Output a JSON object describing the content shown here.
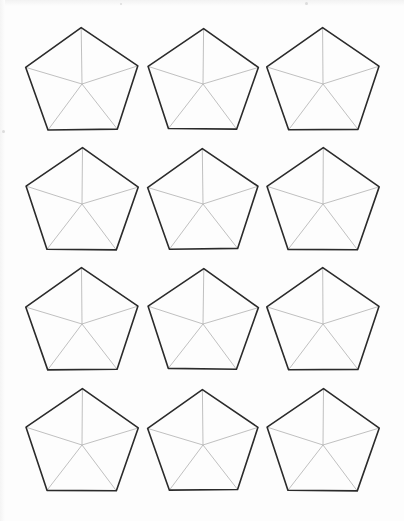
{
  "document": {
    "kind": "printable-worksheet",
    "title": "Pentagon Template Sheet",
    "description": "Grid of blank pentagons each divided into five triangles by lines from the centre to every vertex",
    "background_color": "#fdfdfd",
    "page_width": 404,
    "page_height": 521
  },
  "style": {
    "outline_color": "#2b2b2b",
    "outline_width": 1.6,
    "spoke_color": "#b0b0b0",
    "spoke_width": 0.8,
    "fill_color": "#ffffff"
  },
  "grid": {
    "rows": 4,
    "columns": 3,
    "shape_count": 12,
    "shape_name": "pentagon",
    "sides": 5,
    "spokes_per_shape": 5,
    "triangles_per_shape": 5,
    "column_pitch": 120,
    "row_pitch": 120.5,
    "shape_width": 117,
    "shape_height": 112
  },
  "shapes": [
    {
      "id": "pentagon-r1-c1",
      "row": 1,
      "column": 1,
      "center_x": 82,
      "center_y": 84,
      "radius": 59,
      "rotation": -0.8
    },
    {
      "id": "pentagon-r1-c2",
      "row": 1,
      "column": 2,
      "center_x": 203,
      "center_y": 84,
      "radius": 58,
      "rotation": 0.6
    },
    {
      "id": "pentagon-r1-c3",
      "row": 1,
      "column": 3,
      "center_x": 323,
      "center_y": 84,
      "radius": 59,
      "rotation": -0.4
    },
    {
      "id": "pentagon-r2-c1",
      "row": 2,
      "column": 1,
      "center_x": 82,
      "center_y": 204,
      "radius": 59,
      "rotation": 0.5
    },
    {
      "id": "pentagon-r2-c2",
      "row": 2,
      "column": 2,
      "center_x": 203,
      "center_y": 204,
      "radius": 58,
      "rotation": -0.7
    },
    {
      "id": "pentagon-r2-c3",
      "row": 2,
      "column": 3,
      "center_x": 323,
      "center_y": 204,
      "radius": 59,
      "rotation": 0.3
    },
    {
      "id": "pentagon-r3-c1",
      "row": 3,
      "column": 1,
      "center_x": 82,
      "center_y": 324,
      "radius": 59,
      "rotation": -0.5
    },
    {
      "id": "pentagon-r3-c2",
      "row": 3,
      "column": 2,
      "center_x": 203,
      "center_y": 324,
      "radius": 58,
      "rotation": 0.8
    },
    {
      "id": "pentagon-r3-c3",
      "row": 3,
      "column": 3,
      "center_x": 323,
      "center_y": 324,
      "radius": 59,
      "rotation": -0.3
    },
    {
      "id": "pentagon-r4-c1",
      "row": 4,
      "column": 1,
      "center_x": 82,
      "center_y": 445,
      "radius": 59,
      "rotation": 0.4
    },
    {
      "id": "pentagon-r4-c2",
      "row": 4,
      "column": 2,
      "center_x": 203,
      "center_y": 445,
      "radius": 58,
      "rotation": -0.6
    },
    {
      "id": "pentagon-r4-c3",
      "row": 4,
      "column": 3,
      "center_x": 323,
      "center_y": 445,
      "radius": 59,
      "rotation": 0.5
    }
  ],
  "artifacts": {
    "top_edge_shading": true,
    "left_edge_shading": true,
    "specks": [
      {
        "x": 305,
        "y": 2,
        "size": 3
      },
      {
        "x": 120,
        "y": 3,
        "size": 2
      },
      {
        "x": 2,
        "y": 130,
        "size": 3
      }
    ]
  }
}
